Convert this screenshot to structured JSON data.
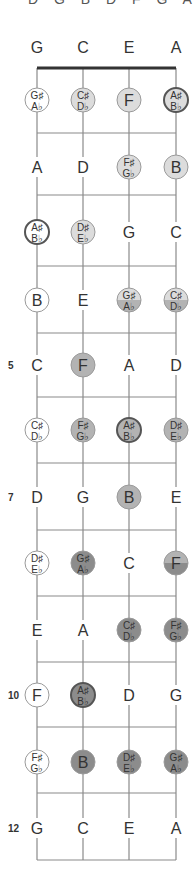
{
  "header_cut_text": "D  G  B  D  F  G  A",
  "diagram": {
    "strings": [
      "G",
      "C",
      "E",
      "A"
    ],
    "colors": {
      "line": "#8a8a8a",
      "nut": "#333333",
      "text": "#333333",
      "white": "#ffffff",
      "light": "#dcdcdc",
      "mid": "#b3b3b3",
      "dark": "#8c8c8c",
      "ring": "#555555",
      "ring_thin": "#9a9a9a"
    },
    "rows": [
      {
        "fret": 0,
        "label": "",
        "notes": [
          {
            "n": "G"
          },
          {
            "n": "C"
          },
          {
            "n": "E"
          },
          {
            "n": "A"
          }
        ]
      },
      {
        "fret": 1,
        "label": "",
        "notes": [
          {
            "s": "G♯",
            "f": "A♭",
            "fill": "white"
          },
          {
            "s": "C♯",
            "f": "D♭",
            "fill": "light"
          },
          {
            "n": "F",
            "fill": "light"
          },
          {
            "s": "A♯",
            "f": "B♭",
            "fill": "light",
            "ring": "dark"
          }
        ]
      },
      {
        "fret": 2,
        "label": "",
        "notes": [
          {
            "n": "A"
          },
          {
            "n": "D"
          },
          {
            "s": "F♯",
            "f": "G♭",
            "fill": "light"
          },
          {
            "n": "B",
            "fill": "light"
          }
        ]
      },
      {
        "fret": 3,
        "label": "",
        "notes": [
          {
            "s": "A♯",
            "f": "B♭",
            "fill": "white",
            "ring": "dark"
          },
          {
            "s": "D♯",
            "f": "E♭",
            "fill": "light"
          },
          {
            "n": "G"
          },
          {
            "n": "C"
          }
        ]
      },
      {
        "fret": 4,
        "label": "",
        "notes": [
          {
            "n": "B",
            "fill": "white"
          },
          {
            "n": "E"
          },
          {
            "s": "G♯",
            "f": "A♭",
            "fill": "light",
            "fill2": "mid"
          },
          {
            "s": "C♯",
            "f": "D♭",
            "fill": "light",
            "fill2": "mid"
          }
        ]
      },
      {
        "fret": 5,
        "label": "5",
        "notes": [
          {
            "n": "C"
          },
          {
            "n": "F",
            "fill": "mid"
          },
          {
            "n": "A"
          },
          {
            "n": "D"
          }
        ]
      },
      {
        "fret": 6,
        "label": "",
        "notes": [
          {
            "s": "C♯",
            "f": "D♭",
            "fill": "white"
          },
          {
            "s": "F♯",
            "f": "G♭",
            "fill": "mid"
          },
          {
            "s": "A♯",
            "f": "B♭",
            "fill": "mid",
            "ring": "dark"
          },
          {
            "s": "D♯",
            "f": "E♭",
            "fill": "mid"
          }
        ]
      },
      {
        "fret": 7,
        "label": "7",
        "notes": [
          {
            "n": "D"
          },
          {
            "n": "G"
          },
          {
            "n": "B",
            "fill": "mid"
          },
          {
            "n": "E"
          }
        ]
      },
      {
        "fret": 8,
        "label": "",
        "notes": [
          {
            "s": "D♯",
            "f": "E♭",
            "fill": "white"
          },
          {
            "s": "G♯",
            "f": "A♭",
            "fill": "dark"
          },
          {
            "n": "C"
          },
          {
            "n": "F",
            "fill": "mid",
            "fill2": "dark"
          }
        ]
      },
      {
        "fret": 9,
        "label": "",
        "notes": [
          {
            "n": "E"
          },
          {
            "n": "A"
          },
          {
            "s": "C♯",
            "f": "D♭",
            "fill": "dark"
          },
          {
            "s": "F♯",
            "f": "G♭",
            "fill": "dark"
          }
        ]
      },
      {
        "fret": 10,
        "label": "10",
        "notes": [
          {
            "n": "F",
            "fill": "white"
          },
          {
            "s": "A♯",
            "f": "B♭",
            "fill": "dark",
            "ring": "dark"
          },
          {
            "n": "D"
          },
          {
            "n": "G"
          }
        ]
      },
      {
        "fret": 11,
        "label": "",
        "notes": [
          {
            "s": "F♯",
            "f": "G♭",
            "fill": "white"
          },
          {
            "n": "B",
            "fill": "dark"
          },
          {
            "s": "D♯",
            "f": "E♭",
            "fill": "dark"
          },
          {
            "s": "G♯",
            "f": "A♭",
            "fill": "dark"
          }
        ]
      },
      {
        "fret": 12,
        "label": "12",
        "notes": [
          {
            "n": "G"
          },
          {
            "n": "C"
          },
          {
            "n": "E"
          },
          {
            "n": "A"
          }
        ]
      }
    ]
  }
}
